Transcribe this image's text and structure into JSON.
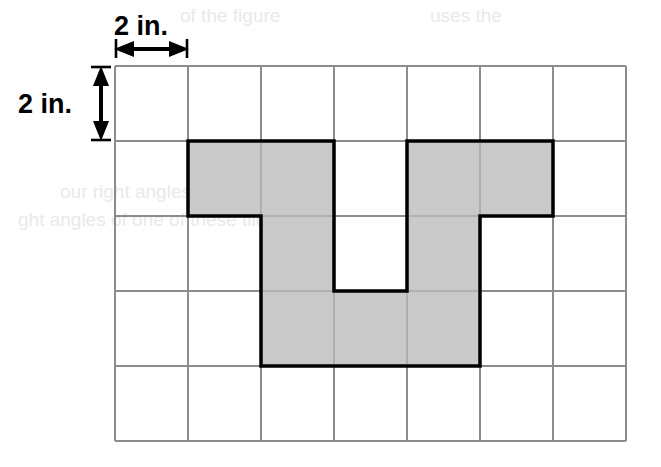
{
  "figure": {
    "type": "geometry-grid-figure",
    "background_color": "#ffffff"
  },
  "grid": {
    "columns": 7,
    "rows": 5,
    "cell_width_px": 73,
    "cell_height_px": 75,
    "origin_x_px": 115,
    "origin_y_px": 66,
    "line_color": "#8c8c8c",
    "line_width_px": 2,
    "cell_side_label": "2 in.",
    "cell_side_value": 2,
    "cell_side_units": "in."
  },
  "labels": {
    "horizontal": {
      "text": "2 in.",
      "orientation": "horizontal",
      "measures": "one grid cell width",
      "x_px": 115,
      "y_px": 30
    },
    "vertical": {
      "text": "2 in.",
      "orientation": "vertical",
      "measures": "one grid cell height",
      "x_px": 30,
      "y_px": 104
    }
  },
  "arrows": {
    "horizontal_arrow": {
      "name": "horizontal-dimension-arrow",
      "from_x_px": 115,
      "to_x_px": 188,
      "y_px": 48,
      "style": "double-headed-with-end-ticks"
    },
    "vertical_arrow": {
      "name": "vertical-dimension-arrow",
      "from_y_px": 66,
      "to_y_px": 141,
      "x_px": 100,
      "style": "double-headed-with-end-ticks"
    }
  },
  "shape": {
    "name": "shaded-u-polygon",
    "fill_color": "#c9c9c9",
    "stroke_color": "#000000",
    "stroke_width_px": 3,
    "description": "U-shaped (squared-off) polygon made of 10 unit grid squares",
    "unit_squares": 10,
    "cells": [
      {
        "col": 1,
        "row": 1
      },
      {
        "col": 2,
        "row": 1
      },
      {
        "col": 4,
        "row": 1
      },
      {
        "col": 5,
        "row": 1
      },
      {
        "col": 2,
        "row": 2
      },
      {
        "col": 4,
        "row": 2
      },
      {
        "col": 2,
        "row": 3
      },
      {
        "col": 3,
        "row": 3
      },
      {
        "col": 4,
        "row": 3
      },
      {
        "col": 5,
        "row": 2
      }
    ],
    "outline_points_grid": [
      [
        1,
        1
      ],
      [
        3,
        1
      ],
      [
        3,
        0.999
      ],
      [
        3,
        1
      ],
      [
        3,
        3
      ],
      [
        4,
        3
      ],
      [
        4,
        1
      ],
      [
        6,
        1
      ],
      [
        6,
        2
      ],
      [
        5,
        2
      ],
      [
        5,
        4
      ],
      [
        2,
        4
      ],
      [
        2,
        2
      ],
      [
        1,
        2
      ]
    ],
    "outline_points_px": [
      [
        188,
        141
      ],
      [
        334,
        141
      ],
      [
        334,
        291
      ],
      [
        407,
        291
      ],
      [
        407,
        141
      ],
      [
        553,
        141
      ],
      [
        553,
        216
      ],
      [
        480,
        216
      ],
      [
        480,
        366
      ],
      [
        261,
        366
      ],
      [
        261,
        216
      ],
      [
        188,
        216
      ]
    ],
    "notch": {
      "name": "interior-notch",
      "fill_color": "#ffffff",
      "x_px": 334,
      "y_px": 141,
      "width_px": 73,
      "height_px": 150
    }
  },
  "ghost_text": {
    "note": "faint bleed-through text from the reverse page",
    "lines": [
      {
        "text": "of the figure",
        "x_px": 180,
        "y_px": 22
      },
      {
        "text": "uses the",
        "x_px": 430,
        "y_px": 22
      },
      {
        "text": "our right angles",
        "x_px": 60,
        "y_px": 198
      },
      {
        "text": "ght angles of one of these tiles.",
        "x_px": 18,
        "y_px": 226
      }
    ]
  }
}
